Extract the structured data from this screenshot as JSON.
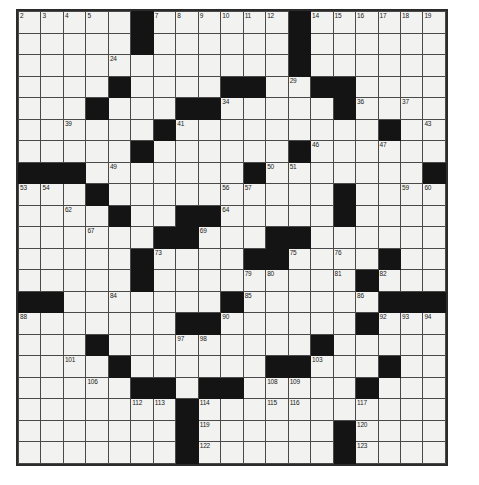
{
  "puzzle": {
    "type": "crossword-grid",
    "columns": 19,
    "rows": 21,
    "background_color": "#ffffff",
    "cell_fill_color": "#f2f2f0",
    "block_color": "#141414",
    "grid_line_color": "#4a4a4a",
    "border_color": "#2b2b2b",
    "max_clue_number": 123,
    "blocks": [
      [
        0,
        5
      ],
      [
        0,
        12
      ],
      [
        1,
        5
      ],
      [
        1,
        12
      ],
      [
        2,
        12
      ],
      [
        3,
        4
      ],
      [
        3,
        9
      ],
      [
        3,
        10
      ],
      [
        3,
        13
      ],
      [
        3,
        14
      ],
      [
        4,
        3
      ],
      [
        4,
        7
      ],
      [
        4,
        8
      ],
      [
        4,
        14
      ],
      [
        5,
        6
      ],
      [
        5,
        16
      ],
      [
        6,
        5
      ],
      [
        6,
        12
      ],
      [
        7,
        0
      ],
      [
        7,
        1
      ],
      [
        7,
        2
      ],
      [
        7,
        10
      ],
      [
        7,
        18
      ],
      [
        8,
        3
      ],
      [
        8,
        14
      ],
      [
        9,
        4
      ],
      [
        9,
        7
      ],
      [
        9,
        8
      ],
      [
        9,
        14
      ],
      [
        10,
        6
      ],
      [
        10,
        7
      ],
      [
        10,
        11
      ],
      [
        10,
        12
      ],
      [
        11,
        5
      ],
      [
        11,
        10
      ],
      [
        11,
        11
      ],
      [
        11,
        16
      ],
      [
        12,
        5
      ],
      [
        12,
        15
      ],
      [
        13,
        0
      ],
      [
        13,
        1
      ],
      [
        13,
        9
      ],
      [
        13,
        16
      ],
      [
        13,
        17
      ],
      [
        13,
        18
      ],
      [
        14,
        7
      ],
      [
        14,
        8
      ],
      [
        14,
        15
      ],
      [
        15,
        3
      ],
      [
        15,
        13
      ],
      [
        16,
        4
      ],
      [
        16,
        11
      ],
      [
        16,
        12
      ],
      [
        16,
        16
      ],
      [
        17,
        5
      ],
      [
        17,
        6
      ],
      [
        17,
        8
      ],
      [
        17,
        9
      ],
      [
        17,
        15
      ],
      [
        18,
        7
      ],
      [
        19,
        7
      ],
      [
        19,
        14
      ],
      [
        20,
        7
      ],
      [
        20,
        14
      ]
    ],
    "numbers": {
      "0,0": 1,
      "0,1": 2,
      "0,2": 3,
      "0,3": 4,
      "0,4": 5,
      "0,6": 6,
      "0,7": 7,
      "0,8": 8,
      "0,9": 9,
      "0,10": 10,
      "0,11": 11,
      "0,12": 12,
      "0,13": 13,
      "0,14": 14,
      "0,15": 15,
      "0,16": 16,
      "0,17": 17,
      "0,18": 18,
      "0,19": 19,
      "1,0": 20,
      "1,6": 21,
      "1,13": 22,
      "2,0": 23,
      "2,5": 24,
      "2,13": 25,
      "3,0": 26,
      "3,5": 27,
      "3,11": 28,
      "3,13": 29,
      "3,15": 30,
      "4,0": 31,
      "4,4": 32,
      "4,9": 33,
      "4,10": 34,
      "4,15": 35,
      "4,16": 36,
      "4,18": 37,
      "5,0": 38,
      "5,3": 39,
      "5,7": 40,
      "5,8": 41,
      "5,17": 42,
      "5,19": 43,
      "6,0": 44,
      "6,6": 45,
      "6,14": 46,
      "6,17": 47,
      "7,3": 48,
      "7,5": 49,
      "7,12": 50,
      "7,13": 51,
      "8,0": 52,
      "8,1": 53,
      "8,2": 54,
      "8,4": 55,
      "8,10": 56,
      "8,11": 57,
      "8,15": 58,
      "8,18": 59,
      "8,19": 60,
      "9,0": 61,
      "9,3": 62,
      "9,5": 63,
      "9,10": 64,
      "9,15": 65,
      "10,0": 66,
      "10,4": 67,
      "10,8": 68,
      "10,9": 69,
      "10,13": 70,
      "11,0": 71,
      "11,6": 72,
      "11,7": 73,
      "11,12": 74,
      "11,13": 75,
      "11,15": 76,
      "12,0": 77,
      "12,6": 78,
      "12,11": 79,
      "12,12": 80,
      "12,15": 81,
      "12,17": 82,
      "13,2": 83,
      "13,5": 84,
      "13,11": 85,
      "13,16": 86,
      "14,0": 87,
      "14,1": 88,
      "14,9": 89,
      "14,10": 90,
      "14,16": 91,
      "14,17": 92,
      "14,18": 93,
      "14,19": 94,
      "15,0": 95,
      "15,4": 96,
      "15,8": 97,
      "15,9": 98,
      "15,14": 99,
      "16,0": 100,
      "16,3": 101,
      "16,5": 102,
      "16,14": 103,
      "16,17": 104,
      "17,0": 105,
      "17,4": 106,
      "17,7": 107,
      "17,12": 108,
      "17,13": 109,
      "17,16": 110,
      "18,0": 111,
      "18,6": 112,
      "18,7": 113,
      "18,9": 114,
      "18,12": 115,
      "18,13": 116,
      "18,16": 117,
      "19,0": 118,
      "19,9": 119,
      "19,16": 120,
      "20,0": 121,
      "20,9": 122,
      "20,16": 123
    }
  }
}
